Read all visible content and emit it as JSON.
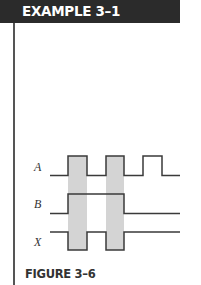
{
  "header": {
    "title": "EXAMPLE 3–1"
  },
  "figure": {
    "caption": "FIGURE 3–6",
    "signals": [
      {
        "name": "A"
      },
      {
        "name": "B"
      },
      {
        "name": "X"
      }
    ],
    "colors": {
      "trace": "#3a3a3a",
      "highlight": "#d4d4d4",
      "header_bg": "#2b2b2b"
    }
  }
}
